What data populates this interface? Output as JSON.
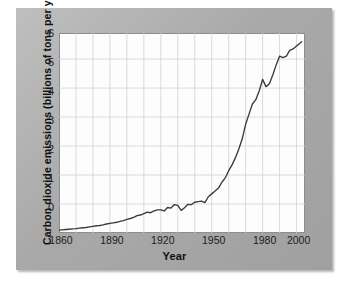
{
  "figure": {
    "background_color": "#ffffff",
    "panel_color": "#b2b2b2",
    "plot_background": "#fdfdfd",
    "line_color": "#3a3a3a",
    "grid_color": "#d2d2d2",
    "axis_color": "#8d8d8d"
  },
  "chart_data": {
    "type": "line",
    "title": "",
    "xlabel": "Year",
    "ylabel": "Carbon dioxide emissions (billions of tons per year)",
    "xlim": [
      1860,
      2005
    ],
    "ylim": [
      0,
      6.9
    ],
    "xticks": [
      1860,
      1890,
      1920,
      1950,
      1980,
      2000
    ],
    "xticklabels": [
      "1860",
      "1890",
      "1920",
      "1950",
      "1980",
      "2000"
    ],
    "yticks": [
      0,
      1,
      2,
      3,
      4,
      5,
      6
    ],
    "yticklabels": [
      "0",
      "1",
      "2",
      "3",
      "4",
      "5",
      "6"
    ],
    "grid": true,
    "grid_x_step": 10,
    "grid_y_step": 1,
    "legend": null,
    "series": [
      {
        "name": "Global carbon dioxide emissions",
        "units": "billions of tons per year",
        "x": [
          1860,
          1862,
          1864,
          1866,
          1868,
          1870,
          1872,
          1874,
          1876,
          1878,
          1880,
          1882,
          1884,
          1886,
          1888,
          1890,
          1892,
          1894,
          1896,
          1898,
          1900,
          1902,
          1904,
          1906,
          1908,
          1910,
          1912,
          1914,
          1916,
          1918,
          1920,
          1922,
          1924,
          1926,
          1928,
          1930,
          1932,
          1934,
          1936,
          1938,
          1940,
          1942,
          1944,
          1946,
          1948,
          1950,
          1952,
          1954,
          1956,
          1958,
          1960,
          1962,
          1964,
          1966,
          1968,
          1970,
          1972,
          1974,
          1976,
          1978,
          1980,
          1982,
          1984,
          1986,
          1988,
          1990,
          1992,
          1994,
          1996,
          1998,
          2000,
          2002,
          2003
        ],
        "y": [
          0.1,
          0.11,
          0.12,
          0.13,
          0.14,
          0.15,
          0.17,
          0.18,
          0.19,
          0.21,
          0.23,
          0.25,
          0.26,
          0.28,
          0.31,
          0.33,
          0.35,
          0.37,
          0.4,
          0.43,
          0.47,
          0.5,
          0.54,
          0.6,
          0.62,
          0.67,
          0.72,
          0.7,
          0.76,
          0.8,
          0.8,
          0.76,
          0.88,
          0.86,
          0.98,
          0.95,
          0.78,
          0.87,
          0.99,
          0.98,
          1.06,
          1.08,
          1.1,
          1.05,
          1.25,
          1.35,
          1.45,
          1.55,
          1.75,
          1.9,
          2.15,
          2.35,
          2.6,
          2.9,
          3.25,
          3.75,
          4.1,
          4.45,
          4.6,
          4.9,
          5.3,
          5.05,
          5.15,
          5.45,
          5.8,
          6.1,
          6.05,
          6.1,
          6.3,
          6.35,
          6.45,
          6.55,
          6.6
        ]
      }
    ],
    "notable_features": [
      {
        "label": "slow early industrial rise",
        "range": "1860-1910",
        "value_range": [
          0.1,
          0.67
        ]
      },
      {
        "label": "World War I dip",
        "year": 1914,
        "value": 0.7
      },
      {
        "label": "Great Depression dip",
        "year": 1932,
        "value": 0.78
      },
      {
        "label": "World War II fluctuation",
        "range": "1940-1946",
        "value_range": [
          1.05,
          1.1
        ]
      },
      {
        "label": "post-war exponential rise",
        "range": "1950-1979",
        "value_range": [
          1.35,
          5.3
        ]
      },
      {
        "label": "oil crisis plateau/decline",
        "range": "1979-1983",
        "value_range": [
          5.0,
          5.3
        ]
      },
      {
        "label": "early 1990s plateau",
        "range": "1990-1993",
        "value_range": [
          6.0,
          6.1
        ]
      },
      {
        "label": "final value",
        "year": 2003,
        "value": 6.6
      }
    ]
  }
}
